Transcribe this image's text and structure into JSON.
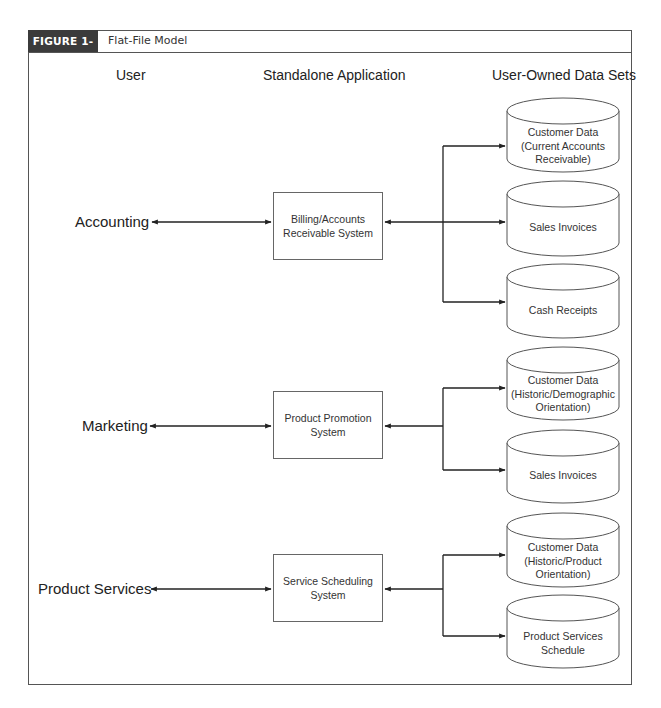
{
  "figure": {
    "label": "FIGURE 1-12",
    "title": "Flat-File Model",
    "header_bg": "#3b3b3b"
  },
  "columns": {
    "user": "User",
    "app": "Standalone Application",
    "data": "User-Owned Data Sets"
  },
  "groups": [
    {
      "user": "Accounting",
      "app_line1": "Billing/Accounts",
      "app_line2": "Receivable System",
      "datasets": [
        {
          "lines": [
            "Customer Data",
            "(Current Accounts",
            "Receivable)"
          ]
        },
        {
          "lines": [
            "Sales Invoices"
          ]
        },
        {
          "lines": [
            "Cash Receipts"
          ]
        }
      ]
    },
    {
      "user": "Marketing",
      "app_line1": "Product Promotion",
      "app_line2": "System",
      "datasets": [
        {
          "lines": [
            "Customer Data",
            "(Historic/Demographic",
            "Orientation)"
          ]
        },
        {
          "lines": [
            "Sales Invoices"
          ]
        }
      ]
    },
    {
      "user": "Product Services",
      "app_line1": "Service Scheduling",
      "app_line2": "System",
      "datasets": [
        {
          "lines": [
            "Customer Data",
            "(Historic/Product",
            "Orientation)"
          ]
        },
        {
          "lines": [
            "Product Services",
            "Schedule"
          ]
        }
      ]
    }
  ]
}
